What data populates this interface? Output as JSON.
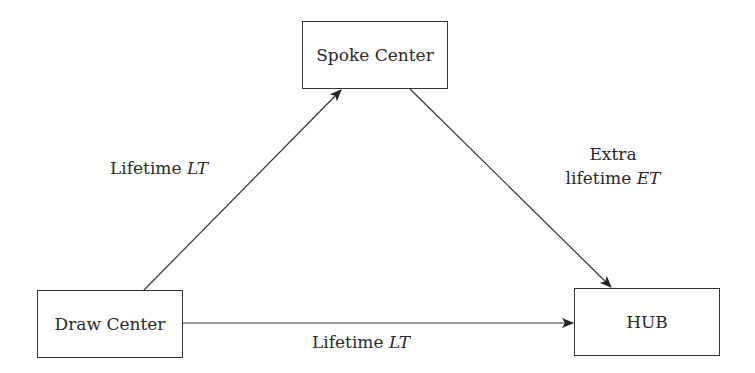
{
  "diagram": {
    "nodes": [
      {
        "id": "spoke",
        "label": "Spoke Center"
      },
      {
        "id": "draw",
        "label": "Draw Center"
      },
      {
        "id": "hub",
        "label": "HUB"
      }
    ],
    "edges": [
      {
        "from": "draw",
        "to": "spoke",
        "label_text": "Lifetime ",
        "label_var": "LT"
      },
      {
        "from": "spoke",
        "to": "hub",
        "label_line1": "Extra",
        "label_text": "lifetime ",
        "label_var": "ET"
      },
      {
        "from": "draw",
        "to": "hub",
        "label_text": "Lifetime ",
        "label_var": "LT"
      }
    ]
  }
}
